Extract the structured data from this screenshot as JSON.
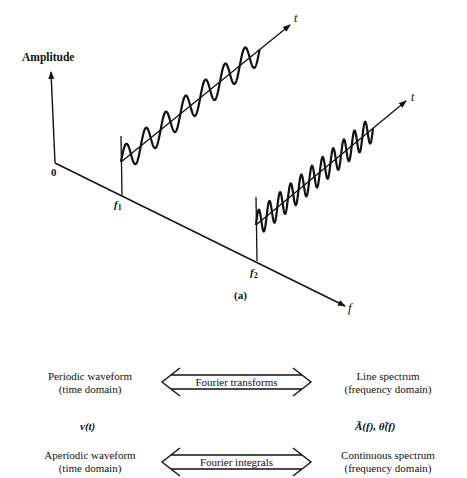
{
  "diagram": {
    "caption": "(a)",
    "axes": {
      "amplitude_label": "Amplitude",
      "origin_label": "0",
      "frequency_axis_label": "f",
      "time_axis_label": "t"
    },
    "components": [
      {
        "name": "f",
        "subscript": "1",
        "time_axis_label": "t",
        "cycles": 7,
        "description": "low-frequency sinusoid along time axis"
      },
      {
        "name": "f",
        "subscript": "2",
        "time_axis_label": "t",
        "cycles": 11,
        "description": "higher-frequency sinusoid along time axis"
      }
    ]
  },
  "relations": [
    {
      "left": {
        "line1": "Periodic waveform",
        "line2": "(time domain)"
      },
      "arrow_label": "Fourier transforms",
      "right": {
        "line1": "Line spectrum",
        "line2": "(frequency domain)"
      }
    },
    {
      "left": {
        "line1": "Aperiodic waveform",
        "line2": "(time domain)"
      },
      "arrow_label": "Fourier integrals",
      "right": {
        "line1": "Continuous spectrum",
        "line2": "(frequency domain)"
      }
    }
  ],
  "symbols": {
    "time_function": "v(t)",
    "spectrum_function": "Ã(f), θ̃(f)"
  },
  "colors": {
    "ink": "#111111",
    "background": "#ffffff"
  }
}
